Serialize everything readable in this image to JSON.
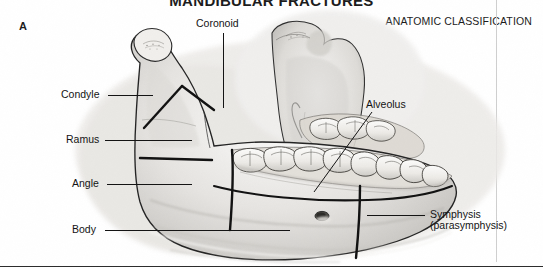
{
  "figure": {
    "title": "MANDIBULAR FRACTURES",
    "panel_letter": "A",
    "section_heading": "ANATOMIC CLASSIFICATION",
    "style": "grayscale-pencil-medical-illustration"
  },
  "labels": {
    "coronoid": "Coronoid",
    "condyle": "Condyle",
    "ramus": "Ramus",
    "angle": "Angle",
    "body": "Body",
    "alveolus": "Alveolus",
    "symphysis": "Symphysis",
    "parasymphysis": "(parasymphysis)"
  },
  "colors": {
    "ink": "#141414",
    "title": "#1b1b1b",
    "rule": "#cfcfcf",
    "bone_light": "#f2f1ef",
    "bone_mid": "#d8d6d2",
    "bone_shadow": "#a9a7a3",
    "background": "#ffffff"
  }
}
